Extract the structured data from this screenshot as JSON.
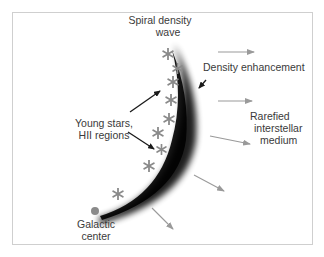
{
  "diagram": {
    "title": "Spiral density wave",
    "labels": {
      "spiral_line1": "Spiral density",
      "spiral_line2": "wave",
      "density_enhancement": "Density enhancement",
      "young_stars_line1": "Young stars,",
      "young_stars_line2": "HII regions",
      "rarefied_line1": "Rarefied",
      "rarefied_line2": "interstellar",
      "rarefied_line3": "medium",
      "galactic_line1": "Galactic",
      "galactic_line2": "center"
    },
    "colors": {
      "frame": "#cfcfcf",
      "text": "#3a3a3a",
      "arm_dark": "#111111",
      "star": "#8a8a8a",
      "flow_arrow": "#9a9a9a",
      "pointer_arrow": "#1a1a1a",
      "galactic_center_dot": "#8a8a8a"
    },
    "elements": {
      "stars_count": 9,
      "flow_arrows_count": 5,
      "pointer_arrows_count": 3
    }
  }
}
